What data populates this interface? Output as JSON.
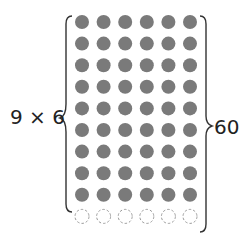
{
  "left_label": "9 × 6",
  "right_label": "60",
  "grid": {
    "rows_filled": 9,
    "rows_empty": 1,
    "cols": 6,
    "filled_color": "#7a7a7a",
    "empty_stroke": "#999999"
  }
}
